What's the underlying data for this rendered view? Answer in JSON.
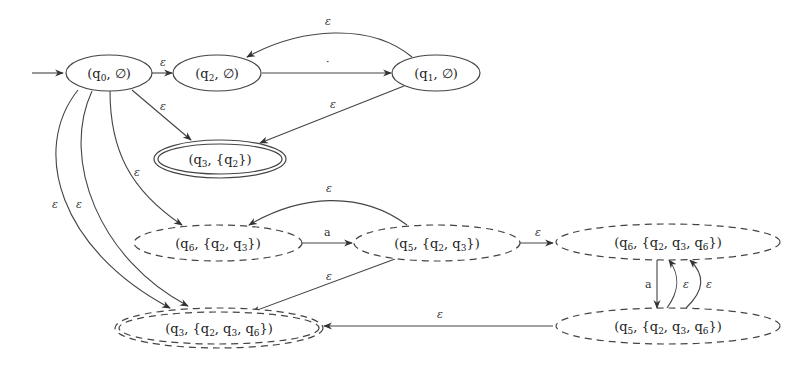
{
  "diagram": {
    "type": "automaton",
    "nodes": [
      {
        "id": "n0",
        "state": "q",
        "sub": "0",
        "set": "∅",
        "style": "solid"
      },
      {
        "id": "n1",
        "state": "q",
        "sub": "2",
        "set": "∅",
        "style": "solid"
      },
      {
        "id": "n2",
        "state": "q",
        "sub": "1",
        "set": "∅",
        "style": "solid"
      },
      {
        "id": "n3",
        "state": "q",
        "sub": "3",
        "set": "{q2}",
        "style": "double-solid",
        "accepting": true
      },
      {
        "id": "n4",
        "state": "q",
        "sub": "6",
        "set": "{q2, q3}",
        "style": "dashed"
      },
      {
        "id": "n5",
        "state": "q",
        "sub": "5",
        "set": "{q2, q3}",
        "style": "dashed"
      },
      {
        "id": "n6",
        "state": "q",
        "sub": "6",
        "set": "{q2, q3, q6}",
        "style": "dashed"
      },
      {
        "id": "n7",
        "state": "q",
        "sub": "5",
        "set": "{q2, q3, q6}",
        "style": "dashed"
      },
      {
        "id": "n8",
        "state": "q",
        "sub": "3",
        "set": "{q2, q3, q6}",
        "style": "double-dashed",
        "accepting": true
      }
    ],
    "labels": {
      "n0": [
        "(q",
        "0",
        ", ∅)"
      ],
      "n1": [
        "(q",
        "2",
        ", ∅)"
      ],
      "n2": [
        "(q",
        "1",
        ", ∅)"
      ],
      "n3": [
        "(q",
        "3",
        ", {q",
        "2",
        "})"
      ],
      "n4": [
        "(q",
        "6",
        ", {q",
        "2",
        ", q",
        "3",
        "})"
      ],
      "n5": [
        "(q",
        "5",
        ", {q",
        "2",
        ", q",
        "3",
        "})"
      ],
      "n6": [
        "(q",
        "6",
        ", {q",
        "2",
        ", q",
        "3",
        ", q",
        "6",
        "})"
      ],
      "n7": [
        "(q",
        "5",
        ", {q",
        "2",
        ", q",
        "3",
        ", q",
        "6",
        "})"
      ],
      "n8": [
        "(q",
        "3",
        ", {q",
        "2",
        ", q",
        "3",
        ", q",
        "6",
        "})"
      ]
    },
    "edges": [
      {
        "from": "start",
        "to": "n0",
        "label": ""
      },
      {
        "from": "n0",
        "to": "n1",
        "label": "ε"
      },
      {
        "from": "n1",
        "to": "n2",
        "label": "·"
      },
      {
        "from": "n2",
        "to": "n1",
        "label": "ε"
      },
      {
        "from": "n0",
        "to": "n3",
        "label": "ε"
      },
      {
        "from": "n2",
        "to": "n3",
        "label": "ε"
      },
      {
        "from": "n0",
        "to": "n4",
        "label": "ε"
      },
      {
        "from": "n0",
        "to": "n8",
        "label": "ε"
      },
      {
        "from": "n0",
        "to": "n8",
        "label": "ε"
      },
      {
        "from": "n4",
        "to": "n5",
        "label": "a"
      },
      {
        "from": "n5",
        "to": "n4",
        "label": "ε"
      },
      {
        "from": "n5",
        "to": "n8",
        "label": "ε"
      },
      {
        "from": "n5",
        "to": "n6",
        "label": "ε"
      },
      {
        "from": "n6",
        "to": "n7",
        "label": "a"
      },
      {
        "from": "n7",
        "to": "n6",
        "label": "ε"
      },
      {
        "from": "n7",
        "to": "n6",
        "label": "ε"
      },
      {
        "from": "n7",
        "to": "n8",
        "label": "ε"
      }
    ],
    "edge_labels": {
      "eps": "ε",
      "dot": "·",
      "a": "a"
    }
  }
}
